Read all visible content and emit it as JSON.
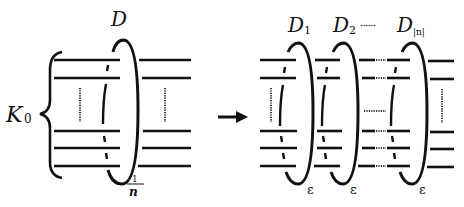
{
  "diagram": {
    "left": {
      "knot_label": "K",
      "knot_subscript": "0",
      "disk_label": "D",
      "twist_numerator": "1",
      "twist_denominator": "n"
    },
    "arrow": "→",
    "right": {
      "disks": [
        {
          "label": "D",
          "subscript": "1",
          "sign": "ε"
        },
        {
          "label": "D",
          "subscript": "2",
          "sign": "ε"
        },
        {
          "label": "D",
          "subscript": "|n|",
          "sign": "ε"
        }
      ],
      "ellipsis": "······"
    }
  }
}
